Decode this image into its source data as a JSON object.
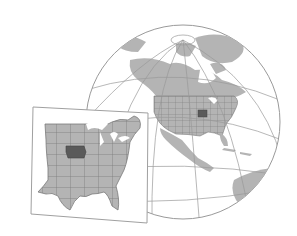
{
  "illustration": {
    "subject": "Globe showing North America with Iowa highlighted, plus inset map of the central/eastern United States with Iowa highlighted",
    "colors": {
      "background": "#ffffff",
      "land": "#b4b4b4",
      "state_border": "#7a7a7a",
      "highlight_state": "#5a5a5a",
      "graticule": "#9a9a9a",
      "frame": "#a0a0a0",
      "water": "#ffffff"
    },
    "globe": {
      "cx": 183,
      "cy": 122,
      "r": 97,
      "label": "north-america-globe"
    },
    "inset": {
      "label": "us-inset-map",
      "corners": [
        [
          33,
          107
        ],
        [
          148,
          113
        ],
        [
          147,
          223
        ],
        [
          31,
          214
        ]
      ]
    },
    "highlight": {
      "name": "Iowa"
    }
  }
}
